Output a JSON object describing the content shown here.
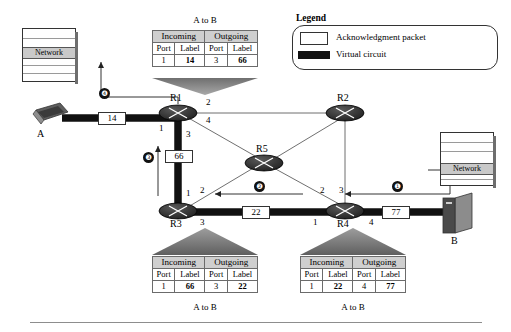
{
  "legend": {
    "title": "Legend",
    "items": [
      {
        "label": "Acknowledgment packet",
        "swatch": "white-box"
      },
      {
        "label": "Virtual circuit",
        "swatch": "black-bar"
      }
    ]
  },
  "tables": [
    {
      "id": "r1-table",
      "caption_top": "A to B",
      "caption_bottom": "",
      "headers": [
        "Incoming",
        "Outgoing"
      ],
      "subheaders": [
        "Port",
        "Label",
        "Port",
        "Label"
      ],
      "row": [
        "1",
        "14",
        "3",
        "66"
      ]
    },
    {
      "id": "r3-table",
      "caption_top": "",
      "caption_bottom": "A to B",
      "headers": [
        "Incoming",
        "Outgoing"
      ],
      "subheaders": [
        "Port",
        "Label",
        "Port",
        "Label"
      ],
      "row": [
        "1",
        "66",
        "3",
        "22"
      ]
    },
    {
      "id": "r4-table",
      "caption_top": "",
      "caption_bottom": "A to B",
      "headers": [
        "Incoming",
        "Outgoing"
      ],
      "subheaders": [
        "Port",
        "Label",
        "Port",
        "Label"
      ],
      "row": [
        "1",
        "22",
        "4",
        "77"
      ]
    }
  ],
  "routers": [
    {
      "id": "R1",
      "name": "R1"
    },
    {
      "id": "R2",
      "name": "R2"
    },
    {
      "id": "R3",
      "name": "R3"
    },
    {
      "id": "R4",
      "name": "R4"
    },
    {
      "id": "R5",
      "name": "R5"
    }
  ],
  "hosts": [
    {
      "id": "A",
      "name": "A",
      "icon": "laptop-icon"
    },
    {
      "id": "B",
      "name": "B",
      "icon": "server-icon"
    }
  ],
  "network_icons": [
    {
      "id": "network-left",
      "label": "Network"
    },
    {
      "id": "network-right",
      "label": "Network"
    }
  ],
  "link_labels": [
    {
      "id": "label-14",
      "value": "14"
    },
    {
      "id": "label-66",
      "value": "66"
    },
    {
      "id": "label-22",
      "value": "22"
    },
    {
      "id": "label-77",
      "value": "77"
    }
  ],
  "callouts": [
    {
      "id": "callout-1",
      "number": "❶"
    },
    {
      "id": "callout-2",
      "number": "❷"
    },
    {
      "id": "callout-3",
      "number": "❸"
    },
    {
      "id": "callout-4",
      "number": "❹"
    }
  ],
  "port_labels": {
    "r1_port_left": "1",
    "r1_port_upper_right": "2",
    "r1_port_down": "3",
    "r1_port_diag": "4",
    "r3_port_up": "1",
    "r3_port_diag": "2",
    "r3_port_right": "3",
    "r4_port_left": "1",
    "r4_port_diag": "2",
    "r4_port_up": "3",
    "r4_port_right": "4"
  },
  "colors": {
    "virtual_circuit": "#111111",
    "thin_link": "#5a5a5a",
    "table_header": "#cfcfcf",
    "router_body": "#2b2b2b",
    "pointer_triangle": "#8a8a8a"
  }
}
